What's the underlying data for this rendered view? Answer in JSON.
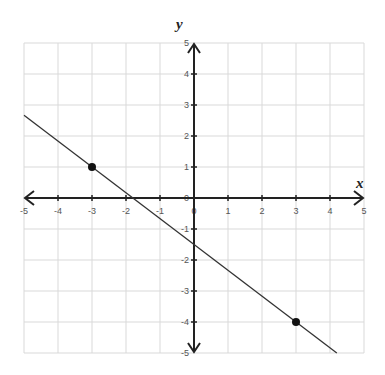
{
  "chart_data": {
    "type": "line",
    "title": "",
    "xlabel": "x",
    "ylabel": "y",
    "xlim": [
      -5,
      5
    ],
    "ylim": [
      -5,
      5
    ],
    "grid": true,
    "x_ticks": [
      -5,
      -4,
      -3,
      -2,
      -1,
      0,
      1,
      2,
      3,
      4,
      5
    ],
    "y_ticks": [
      -5,
      -4,
      -3,
      -2,
      -1,
      0,
      1,
      2,
      3,
      4,
      5
    ],
    "series": [
      {
        "name": "line",
        "equation": "y = -5/6 x - 1.5",
        "slope": -0.8333,
        "intercept": -1.5,
        "x": [
          -5,
          4.2
        ],
        "y": [
          2.667,
          -5
        ]
      }
    ],
    "points": [
      {
        "x": -3,
        "y": 1
      },
      {
        "x": 3,
        "y": -4
      }
    ],
    "colors": {
      "grid": "#d9d9d9",
      "axis": "#222222",
      "line": "#333333",
      "point": "#111111"
    }
  }
}
